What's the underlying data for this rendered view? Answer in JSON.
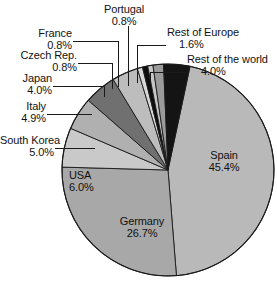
{
  "chart_data": {
    "type": "pie",
    "title": "",
    "xlabel": "",
    "ylabel": "",
    "legend_position": "none",
    "grid": false,
    "units": "%",
    "start_angle_deg": 12,
    "direction": "clockwise",
    "categories": [
      "Spain",
      "Germany",
      "USA",
      "South Korea",
      "Italy",
      "Japan",
      "Czech Rep.",
      "France",
      "Portugal",
      "Rest of Europe",
      "Rest of the world"
    ],
    "values": [
      45.4,
      26.7,
      6.0,
      5.0,
      4.9,
      4.0,
      0.8,
      0.8,
      0.8,
      1.6,
      4.0
    ],
    "colors": [
      "#b9b9b9",
      "#a8a8a8",
      "#c9c9c9",
      "#b0b0b0",
      "#707070",
      "#bdbdbd",
      "#d8d8d8",
      "#0d0d0d",
      "#c6c6c6",
      "#9a9a9a",
      "#141414"
    ],
    "slices": [
      {
        "label": "Spain",
        "value": 45.4,
        "display": "45.4%",
        "color": "#b9b9b9",
        "label_placement": "inside"
      },
      {
        "label": "Germany",
        "value": 26.7,
        "display": "26.7%",
        "color": "#a8a8a8",
        "label_placement": "inside"
      },
      {
        "label": "USA",
        "value": 6.0,
        "display": "6.0%",
        "color": "#c9c9c9",
        "label_placement": "inside"
      },
      {
        "label": "South Korea",
        "value": 5.0,
        "display": "5.0%",
        "color": "#b0b0b0",
        "label_placement": "outside"
      },
      {
        "label": "Italy",
        "value": 4.9,
        "display": "4.9%",
        "color": "#707070",
        "label_placement": "outside"
      },
      {
        "label": "Japan",
        "value": 4.0,
        "display": "4.0%",
        "color": "#bdbdbd",
        "label_placement": "outside"
      },
      {
        "label": "Czech Rep.",
        "value": 0.8,
        "display": "0.8%",
        "color": "#d8d8d8",
        "label_placement": "outside"
      },
      {
        "label": "France",
        "value": 0.8,
        "display": "0.8%",
        "color": "#0d0d0d",
        "label_placement": "outside"
      },
      {
        "label": "Portugal",
        "value": 0.8,
        "display": "0.8%",
        "color": "#c6c6c6",
        "label_placement": "outside"
      },
      {
        "label": "Rest of Europe",
        "value": 1.6,
        "display": "1.6%",
        "color": "#9a9a9a",
        "label_placement": "outside"
      },
      {
        "label": "Rest of the world",
        "value": 4.0,
        "display": "4.0%",
        "color": "#141414",
        "label_placement": "outside"
      }
    ]
  },
  "labels": {
    "spain": {
      "name": "Spain",
      "pct": "45.4%"
    },
    "germany": {
      "name": "Germany",
      "pct": "26.7%"
    },
    "usa": {
      "name": "USA",
      "pct": "6.0%"
    },
    "south_korea": {
      "name": "South Korea",
      "pct": "5.0%"
    },
    "italy": {
      "name": "Italy",
      "pct": "4.9%"
    },
    "japan": {
      "name": "Japan",
      "pct": "4.0%"
    },
    "czech": {
      "name": "Czech Rep.",
      "pct": "0.8%"
    },
    "france": {
      "name": "France",
      "pct": "0.8%"
    },
    "portugal": {
      "name": "Portugal",
      "pct": "0.8%"
    },
    "rest_europe": {
      "name": "Rest of Europe",
      "pct": "1.6%"
    },
    "rest_world": {
      "name": "Rest of the world",
      "pct": "4.0%"
    }
  }
}
